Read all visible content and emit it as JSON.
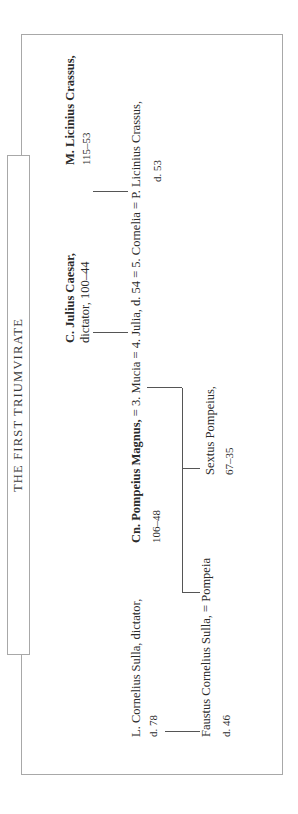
{
  "title": "THE FIRST TRIUMVIRATE",
  "people": {
    "sulla": {
      "name": "L. Cornelius Sulla, dictator,",
      "dates": "d. 78"
    },
    "faustus": {
      "name": "Faustus Cornelius Sulla, = Pompeia",
      "dates": "d. 46"
    },
    "pompeius": {
      "name_bold": "Cn. Pompeius Magnus,",
      "marriages": " = 3. Mucia = 4. Julia, d. 54 = 5. Cornelia = P. Licinius Crassus,",
      "dates": "106–48"
    },
    "publius_crassus": {
      "dates": "d. 53"
    },
    "sextus": {
      "name": "Sextus Pompeius,",
      "dates": "67–35"
    },
    "caesar": {
      "name_bold": "C. Julius Caesar,",
      "title": "dictator, 100–44"
    },
    "crassus": {
      "name_bold": "M. Licinius Crassus,",
      "dates": "115–53"
    }
  }
}
